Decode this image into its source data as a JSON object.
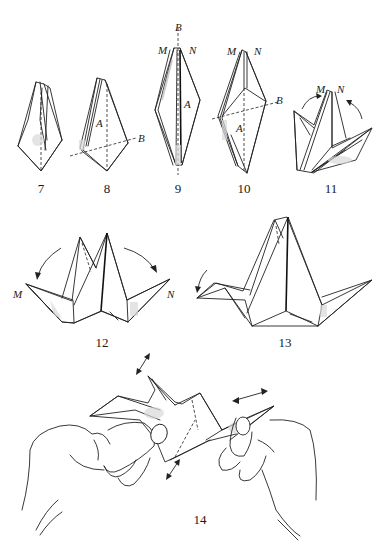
{
  "figure": {
    "steps": [
      {
        "number": "7",
        "x": 41,
        "y": 184
      },
      {
        "number": "8",
        "x": 107,
        "y": 184
      },
      {
        "number": "9",
        "x": 178,
        "y": 184
      },
      {
        "number": "10",
        "x": 244,
        "y": 184
      },
      {
        "number": "11",
        "x": 331,
        "y": 184
      },
      {
        "number": "12",
        "x": 102,
        "y": 337
      },
      {
        "number": "13",
        "x": 285,
        "y": 337
      },
      {
        "number": "14",
        "x": 200,
        "y": 515
      }
    ],
    "point_labels": [
      {
        "text": "A",
        "x": 96,
        "y": 124,
        "step": "8"
      },
      {
        "text": "B",
        "x": 137,
        "y": 134,
        "step": "8"
      },
      {
        "text": "B",
        "x": 175,
        "y": 20,
        "step": "9"
      },
      {
        "text": "M",
        "x": 157,
        "y": 44,
        "step": "9"
      },
      {
        "text": "N",
        "x": 189,
        "y": 44,
        "step": "9"
      },
      {
        "text": "A",
        "x": 184,
        "y": 99,
        "step": "9"
      },
      {
        "text": "M",
        "x": 227,
        "y": 44,
        "step": "10"
      },
      {
        "text": "N",
        "x": 254,
        "y": 44,
        "step": "10"
      },
      {
        "text": "B",
        "x": 274,
        "y": 94,
        "step": "10"
      },
      {
        "text": "A",
        "x": 236,
        "y": 122,
        "step": "10"
      },
      {
        "text": "M",
        "x": 313,
        "y": 84,
        "step": "11"
      },
      {
        "text": "N",
        "x": 337,
        "y": 84,
        "step": "11"
      },
      {
        "text": "M",
        "x": 13,
        "y": 289,
        "step": "12"
      },
      {
        "text": "N",
        "x": 166,
        "y": 289,
        "step": "12"
      }
    ]
  }
}
